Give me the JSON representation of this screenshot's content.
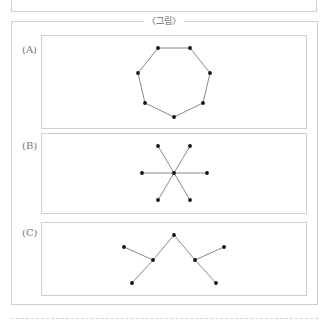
{
  "figure": {
    "title": "〈그림〉",
    "panels": [
      {
        "label": "(A)",
        "shape": "heptagon-cycle",
        "nodes": [
          [
            158,
            48
          ],
          [
            190,
            48
          ],
          [
            210,
            73
          ],
          [
            203,
            103
          ],
          [
            174,
            117
          ],
          [
            145,
            103
          ],
          [
            138,
            73
          ]
        ],
        "edges": [
          [
            0,
            1
          ],
          [
            1,
            2
          ],
          [
            2,
            3
          ],
          [
            3,
            4
          ],
          [
            4,
            5
          ],
          [
            5,
            6
          ],
          [
            6,
            0
          ]
        ]
      },
      {
        "label": "(B)",
        "shape": "star",
        "nodes": [
          [
            174,
            173
          ],
          [
            158,
            146
          ],
          [
            190,
            146
          ],
          [
            142,
            173
          ],
          [
            207,
            173
          ],
          [
            158,
            200
          ],
          [
            190,
            200
          ]
        ],
        "edges": [
          [
            0,
            1
          ],
          [
            0,
            2
          ],
          [
            0,
            3
          ],
          [
            0,
            4
          ],
          [
            0,
            5
          ],
          [
            0,
            6
          ]
        ]
      },
      {
        "label": "(C)",
        "shape": "tree",
        "nodes": [
          [
            174,
            235
          ],
          [
            153,
            260
          ],
          [
            195,
            260
          ],
          [
            124,
            247
          ],
          [
            224,
            247
          ],
          [
            132,
            283
          ],
          [
            216,
            283
          ]
        ],
        "edges": [
          [
            0,
            1
          ],
          [
            0,
            2
          ],
          [
            1,
            3
          ],
          [
            1,
            5
          ],
          [
            2,
            4
          ],
          [
            2,
            6
          ]
        ]
      }
    ]
  },
  "colors": {
    "border": "#cfcfcf",
    "edge": "#8a8a8a",
    "node": "#111111",
    "text": "#666666"
  }
}
